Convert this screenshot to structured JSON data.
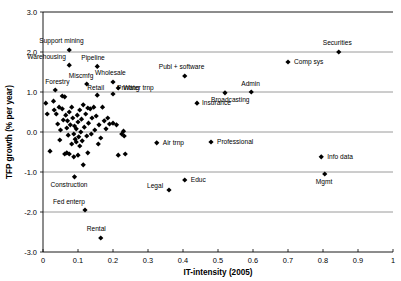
{
  "chart_data": {
    "type": "scatter",
    "title": "",
    "xlabel": "IT-intensity (2005)",
    "ylabel": "TFP growth (% per year)",
    "xlim": [
      0,
      1
    ],
    "ylim": [
      -3.0,
      3.0
    ],
    "xticks": [
      "0",
      "0.1",
      "0.2",
      "0.3",
      "0.4",
      "0.5",
      "0.6",
      "0.7",
      "0.8",
      "0.9",
      "1"
    ],
    "xtick_values": [
      0,
      0.1,
      0.2,
      0.3,
      0.4,
      0.5,
      0.6,
      0.7,
      0.8,
      0.9,
      1.0
    ],
    "yticks": [
      "3.0",
      "2.0",
      "1.0",
      "0.0",
      "-1.0",
      "-2.0",
      "-3.0"
    ],
    "ytick_values": [
      3.0,
      2.0,
      1.0,
      0.0,
      -1.0,
      -2.0,
      -3.0
    ],
    "grid": "horizontal",
    "legend": "none",
    "marker": "diamond",
    "marker_color": "#000000",
    "labeled_points": [
      {
        "label": "Support mining",
        "x": 0.075,
        "y": 2.05,
        "lx": -30,
        "ly": -7
      },
      {
        "label": "Warehousing",
        "x": 0.075,
        "y": 1.67,
        "lx": -42,
        "ly": -6
      },
      {
        "label": "Pipeline",
        "x": 0.155,
        "y": 1.64,
        "lx": -16,
        "ly": -6
      },
      {
        "label": "Forestry",
        "x": 0.035,
        "y": 1.05,
        "lx": -10,
        "ly": -6
      },
      {
        "label": "Miscmfg",
        "x": 0.125,
        "y": 1.2,
        "lx": -18,
        "ly": -6
      },
      {
        "label": "Wholesale",
        "x": 0.2,
        "y": 1.25,
        "lx": -18,
        "ly": -7
      },
      {
        "label": "Water trnp",
        "x": 0.215,
        "y": 1.1,
        "lx": 5,
        "ly": 2
      },
      {
        "label": "Retail",
        "x": 0.155,
        "y": 0.92,
        "lx": -10,
        "ly": -5
      },
      {
        "label": "Printing",
        "x": 0.2,
        "y": 0.95,
        "lx": 4,
        "ly": -4
      },
      {
        "label": "Publ + software",
        "x": 0.405,
        "y": 1.4,
        "lx": -26,
        "ly": -7
      },
      {
        "label": "Insurance",
        "x": 0.44,
        "y": 0.72,
        "lx": 5,
        "ly": 2
      },
      {
        "label": "Broadcasting",
        "x": 0.52,
        "y": 0.98,
        "lx": -14,
        "ly": 9
      },
      {
        "label": "Admin",
        "x": 0.595,
        "y": 1.0,
        "lx": -10,
        "ly": -6
      },
      {
        "label": "Comp sys",
        "x": 0.7,
        "y": 1.75,
        "lx": 6,
        "ly": 2
      },
      {
        "label": "Securities",
        "x": 0.845,
        "y": 2.0,
        "lx": -16,
        "ly": -7
      },
      {
        "label": "Air trnp",
        "x": 0.325,
        "y": -0.27,
        "lx": 6,
        "ly": 2
      },
      {
        "label": "Professional",
        "x": 0.48,
        "y": -0.25,
        "lx": 6,
        "ly": 2
      },
      {
        "label": "Info data",
        "x": 0.795,
        "y": -0.62,
        "lx": 6,
        "ly": 2
      },
      {
        "label": "Mgmt",
        "x": 0.805,
        "y": -1.05,
        "lx": -9,
        "ly": 10
      },
      {
        "label": "Legal",
        "x": 0.36,
        "y": -1.45,
        "lx": -22,
        "ly": -2
      },
      {
        "label": "Educ",
        "x": 0.405,
        "y": -1.2,
        "lx": 6,
        "ly": 2
      },
      {
        "label": "Construction",
        "x": 0.09,
        "y": -1.12,
        "lx": -24,
        "ly": 10
      },
      {
        "label": "Fed enterp",
        "x": 0.12,
        "y": -1.95,
        "lx": -32,
        "ly": -6
      },
      {
        "label": "Rental",
        "x": 0.165,
        "y": -2.65,
        "lx": -14,
        "ly": -7
      }
    ],
    "unlabeled_points": [
      {
        "x": 0.008,
        "y": 0.72
      },
      {
        "x": 0.012,
        "y": 0.45
      },
      {
        "x": 0.03,
        "y": 0.77
      },
      {
        "x": 0.032,
        "y": 0.55
      },
      {
        "x": 0.038,
        "y": 0.45
      },
      {
        "x": 0.042,
        "y": 0.2
      },
      {
        "x": 0.046,
        "y": 0.62
      },
      {
        "x": 0.05,
        "y": 0.05
      },
      {
        "x": 0.055,
        "y": 0.58
      },
      {
        "x": 0.058,
        "y": 0.3
      },
      {
        "x": 0.062,
        "y": 0.88
      },
      {
        "x": 0.065,
        "y": 0.42
      },
      {
        "x": 0.068,
        "y": 0.1
      },
      {
        "x": 0.07,
        "y": 0.28
      },
      {
        "x": 0.072,
        "y": -0.08
      },
      {
        "x": 0.075,
        "y": 0.5
      },
      {
        "x": 0.078,
        "y": 0.18
      },
      {
        "x": 0.082,
        "y": 0.62
      },
      {
        "x": 0.085,
        "y": 0.35
      },
      {
        "x": 0.088,
        "y": -0.05
      },
      {
        "x": 0.09,
        "y": 0.15
      },
      {
        "x": 0.092,
        "y": -0.18
      },
      {
        "x": 0.095,
        "y": 0.08
      },
      {
        "x": 0.098,
        "y": 0.42
      },
      {
        "x": 0.1,
        "y": 0.25
      },
      {
        "x": 0.102,
        "y": -0.12
      },
      {
        "x": 0.105,
        "y": 0.55
      },
      {
        "x": 0.108,
        "y": 0.0
      },
      {
        "x": 0.11,
        "y": 0.32
      },
      {
        "x": 0.112,
        "y": -0.22
      },
      {
        "x": 0.115,
        "y": 0.68
      },
      {
        "x": 0.118,
        "y": 0.12
      },
      {
        "x": 0.122,
        "y": 0.45
      },
      {
        "x": 0.125,
        "y": -0.1
      },
      {
        "x": 0.128,
        "y": 0.6
      },
      {
        "x": 0.13,
        "y": 0.22
      },
      {
        "x": 0.135,
        "y": 0.58
      },
      {
        "x": 0.14,
        "y": 0.35
      },
      {
        "x": 0.145,
        "y": 0.62
      },
      {
        "x": 0.148,
        "y": 0.05
      },
      {
        "x": 0.152,
        "y": 0.4
      },
      {
        "x": 0.16,
        "y": 0.18
      },
      {
        "x": 0.165,
        "y": -0.15
      },
      {
        "x": 0.17,
        "y": 0.62
      },
      {
        "x": 0.175,
        "y": 0.28
      },
      {
        "x": 0.18,
        "y": 0.08
      },
      {
        "x": 0.185,
        "y": 0.35
      },
      {
        "x": 0.19,
        "y": 0.2
      },
      {
        "x": 0.2,
        "y": 0.22
      },
      {
        "x": 0.21,
        "y": 0.18
      },
      {
        "x": 0.225,
        "y": -0.05
      },
      {
        "x": 0.23,
        "y": 0.02
      },
      {
        "x": 0.232,
        "y": -0.1
      },
      {
        "x": 0.235,
        "y": -0.55
      },
      {
        "x": 0.215,
        "y": -0.58
      },
      {
        "x": 0.02,
        "y": -0.48
      },
      {
        "x": 0.062,
        "y": -0.55
      },
      {
        "x": 0.068,
        "y": -0.52
      },
      {
        "x": 0.075,
        "y": -0.55
      },
      {
        "x": 0.088,
        "y": -0.62
      },
      {
        "x": 0.1,
        "y": -0.58
      },
      {
        "x": 0.105,
        "y": -0.35
      },
      {
        "x": 0.115,
        "y": -0.82
      },
      {
        "x": 0.128,
        "y": -0.52
      },
      {
        "x": 0.055,
        "y": 0.9
      },
      {
        "x": 0.048,
        "y": -0.2
      },
      {
        "x": 0.082,
        "y": -0.3
      },
      {
        "x": 0.095,
        "y": -0.25
      },
      {
        "x": 0.138,
        "y": -0.05
      },
      {
        "x": 0.158,
        "y": -0.3
      }
    ]
  },
  "geometry": {
    "plot_left": 43,
    "plot_right": 393,
    "plot_top": 12,
    "plot_bottom": 252
  }
}
